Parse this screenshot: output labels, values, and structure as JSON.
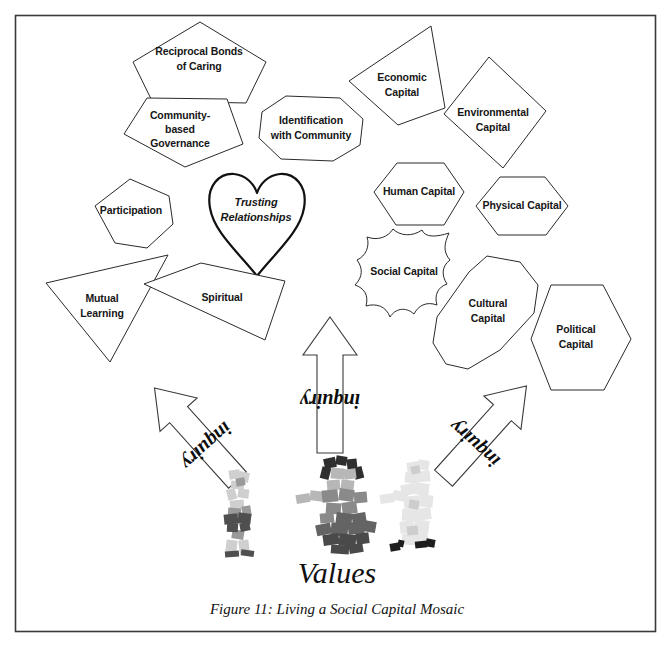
{
  "figure": {
    "border_color": "#3b3b3b",
    "background": "#ffffff",
    "values_label": "Values",
    "caption": "Figure 11: Living a Social Capital Mosaic"
  },
  "shapes": [
    {
      "id": "reciprocal-bonds-of-caring",
      "name": "Reciprocal Bonds of Caring",
      "lines": [
        "Reciprocal Bonds",
        "of Caring"
      ],
      "form": "pentagon",
      "cx": 198,
      "cy": 57
    },
    {
      "id": "community-based-governance",
      "name": "Community-based Governance",
      "lines": [
        "Community-",
        "based",
        "Governance"
      ],
      "form": "pentagon",
      "cx": 178,
      "cy": 128
    },
    {
      "id": "identification-with-community",
      "name": "Identification with Community",
      "lines": [
        "Identification",
        "with Community"
      ],
      "form": "octagon",
      "cx": 311,
      "cy": 127
    },
    {
      "id": "economic-capital",
      "name": "Economic Capital",
      "lines": [
        "Economic",
        "Capital"
      ],
      "form": "quadrilateral",
      "cx": 399,
      "cy": 84
    },
    {
      "id": "environmental-capital",
      "name": "Environmental Capital",
      "lines": [
        "Environmental",
        "Capital"
      ],
      "form": "rhombus",
      "cx": 491,
      "cy": 120
    },
    {
      "id": "human-capital",
      "name": "Human Capital",
      "lines": [
        "Human Capital"
      ],
      "form": "hexagon",
      "cx": 418,
      "cy": 192
    },
    {
      "id": "physical-capital",
      "name": "Physical Capital",
      "lines": [
        "Physical Capital"
      ],
      "form": "hexagon",
      "cx": 521,
      "cy": 206
    },
    {
      "id": "participation",
      "name": "Participation",
      "lines": [
        "Participation"
      ],
      "form": "hexagon",
      "cx": 129,
      "cy": 211
    },
    {
      "id": "trusting-relationships",
      "name": "Trusting Relationships",
      "lines": [
        "Trusting",
        "Relationships"
      ],
      "form": "heart",
      "cx": 257,
      "cy": 210
    },
    {
      "id": "mutual-learning",
      "name": "Mutual Learning",
      "lines": [
        "Mutual",
        "Learning"
      ],
      "form": "triangle",
      "cx": 101,
      "cy": 303
    },
    {
      "id": "spiritual",
      "name": "Spiritual",
      "lines": [
        "Spiritual"
      ],
      "form": "parallelogram",
      "cx": 219,
      "cy": 297
    },
    {
      "id": "social-capital",
      "name": "Social Capital",
      "lines": [
        "Social Capital"
      ],
      "form": "scalloped",
      "cx": 404,
      "cy": 272
    },
    {
      "id": "cultural-capital",
      "name": "Cultural Capital",
      "lines": [
        "Cultural",
        "Capital"
      ],
      "form": "elongated-octagon",
      "cx": 487,
      "cy": 308
    },
    {
      "id": "political-capital",
      "name": "Political Capital",
      "lines": [
        "Political",
        "Capital"
      ],
      "form": "vertical-hexagon",
      "cx": 573,
      "cy": 336
    }
  ],
  "arrows": [
    {
      "id": "arrow-left",
      "label": "inquiry",
      "direction": "up-right",
      "rotation": -42
    },
    {
      "id": "arrow-center",
      "label": "inquiry",
      "direction": "up",
      "rotation": 0
    },
    {
      "id": "arrow-right",
      "label": "inquiry",
      "direction": "up-left",
      "rotation": 42
    }
  ],
  "people": [
    {
      "id": "person-left",
      "tone": "#c9c9c9"
    },
    {
      "id": "person-center",
      "tone": "#8f8f8f"
    },
    {
      "id": "person-right",
      "tone": "#e2e2e2"
    }
  ]
}
